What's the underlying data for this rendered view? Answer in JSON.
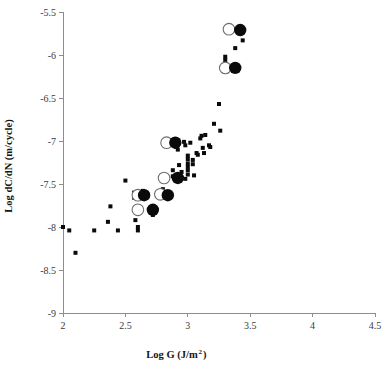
{
  "chart_data": {
    "type": "scatter",
    "title": "",
    "xlabel": "Log  G (J/m2)",
    "xlabel_main": "Log  G (J/m",
    "xlabel_sup": "2",
    "xlabel_tail": ")",
    "ylabel": "Log dC/dN (m/cycle)",
    "xlim": [
      2,
      4.5
    ],
    "ylim": [
      -9,
      -5.5
    ],
    "xticks": [
      2,
      2.5,
      3,
      3.5,
      4,
      4.5
    ],
    "xtick_labels": [
      "2",
      "2.5",
      "3",
      "3.5",
      "4",
      "4.5"
    ],
    "yticks": [
      -5.5,
      -6,
      -6.5,
      -7,
      -7.5,
      -8,
      -8.5,
      -9
    ],
    "ytick_labels": [
      "-5.5",
      "-6",
      "-6.5",
      "-7",
      "-7.5",
      "-8",
      "-8.5",
      "-9"
    ],
    "grid": false,
    "legend": "none",
    "marker_colors": {
      "small_filled": "#0a0a0a",
      "large_filled": "#0a0a0a",
      "large_open_fill": "#ffffff",
      "large_open_stroke": "#6f6f6f",
      "axis": "#8d8d8d",
      "text": "#141414"
    },
    "series": [
      {
        "name": "small-filled-squares",
        "marker": "small-filled-square",
        "points": [
          [
            2.0,
            -8.0
          ],
          [
            2.05,
            -8.04
          ],
          [
            2.1,
            -8.3
          ],
          [
            2.25,
            -8.04
          ],
          [
            2.36,
            -7.94
          ],
          [
            2.38,
            -7.76
          ],
          [
            2.44,
            -8.04
          ],
          [
            2.5,
            -7.46
          ],
          [
            2.57,
            -7.6
          ],
          [
            2.57,
            -7.66
          ],
          [
            2.58,
            -7.92
          ],
          [
            2.6,
            -8.0
          ],
          [
            2.6,
            -8.04
          ],
          [
            2.64,
            -7.58
          ],
          [
            2.72,
            -7.86
          ],
          [
            2.8,
            -7.56
          ],
          [
            2.88,
            -7.41
          ],
          [
            2.88,
            -7.34
          ],
          [
            2.9,
            -7.02
          ],
          [
            2.91,
            -7.07
          ],
          [
            2.92,
            -7.1
          ],
          [
            2.93,
            -7.28
          ],
          [
            2.95,
            -7.36
          ],
          [
            2.95,
            -7.43
          ],
          [
            2.97,
            -7.01
          ],
          [
            2.98,
            -7.05
          ],
          [
            2.98,
            -7.44
          ],
          [
            3.0,
            -7.17
          ],
          [
            3.0,
            -7.21
          ],
          [
            3.0,
            -7.26
          ],
          [
            3.0,
            -7.3
          ],
          [
            3.0,
            -7.34
          ],
          [
            3.0,
            -7.39
          ],
          [
            3.02,
            -7.02
          ],
          [
            3.04,
            -7.22
          ],
          [
            3.04,
            -7.27
          ],
          [
            3.05,
            -7.4
          ],
          [
            3.07,
            -7.14
          ],
          [
            3.08,
            -7.16
          ],
          [
            3.1,
            -6.97
          ],
          [
            3.11,
            -6.94
          ],
          [
            3.12,
            -7.08
          ],
          [
            3.13,
            -7.14
          ],
          [
            3.14,
            -6.93
          ],
          [
            3.17,
            -7.05
          ],
          [
            3.18,
            -7.07
          ],
          [
            3.21,
            -6.8
          ],
          [
            3.25,
            -6.57
          ],
          [
            3.26,
            -6.88
          ],
          [
            3.3,
            -6.06
          ],
          [
            3.3,
            -6.02
          ],
          [
            3.31,
            -6.19
          ],
          [
            3.38,
            -5.92
          ],
          [
            3.44,
            -5.83
          ]
        ]
      },
      {
        "name": "large-open-circles",
        "marker": "large-open-circle",
        "points": [
          [
            2.6,
            -7.63
          ],
          [
            2.6,
            -7.8
          ],
          [
            2.78,
            -7.62
          ],
          [
            2.81,
            -7.43
          ],
          [
            2.83,
            -7.02
          ],
          [
            3.3,
            -6.15
          ],
          [
            3.33,
            -5.7
          ]
        ]
      },
      {
        "name": "large-filled-circles",
        "marker": "large-filled-circle",
        "points": [
          [
            2.65,
            -7.63
          ],
          [
            2.72,
            -7.8
          ],
          [
            2.84,
            -7.63
          ],
          [
            2.92,
            -7.43
          ],
          [
            2.9,
            -7.02
          ],
          [
            3.38,
            -6.15
          ],
          [
            3.42,
            -5.71
          ]
        ]
      }
    ]
  }
}
